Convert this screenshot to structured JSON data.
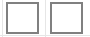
{
  "canvas": {
    "width": 90,
    "height": 37,
    "background_color": "#ffffff"
  },
  "theme": {
    "border_color": "#808080",
    "border_color_light": "#9a9a9a",
    "fill_color": "#ffffff",
    "guide_color": "#e6e6e6"
  },
  "guides": [
    {
      "name": "left-guide",
      "orientation": "vertical",
      "position": 2
    },
    {
      "name": "middle-guide",
      "orientation": "vertical",
      "position": 45
    },
    {
      "name": "bottom-guide",
      "orientation": "horizontal",
      "position": 35
    }
  ],
  "checkboxes": [
    {
      "id": "checkbox-1",
      "label": "",
      "checked": false,
      "state": "unchecked",
      "border_color": "#808080",
      "fill_color": "#ffffff",
      "x": 6,
      "y": 2,
      "width": 33,
      "height": 32
    },
    {
      "id": "checkbox-2",
      "label": "",
      "checked": false,
      "state": "unchecked",
      "border_color": "#808080",
      "fill_color": "#ffffff",
      "x": 50,
      "y": 2,
      "width": 33,
      "height": 32
    }
  ]
}
